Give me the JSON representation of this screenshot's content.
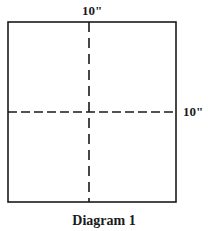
{
  "diagram": {
    "title": "Diagram 1",
    "shape": "square",
    "dimensions": {
      "top_label": "10\"",
      "right_label": "10\""
    },
    "fold_lines": [
      {
        "orientation": "vertical",
        "style": "dashed",
        "position": "center"
      },
      {
        "orientation": "horizontal",
        "style": "dashed",
        "position": "center"
      }
    ],
    "colors": {
      "stroke": "#1a1a1a",
      "background": "#ffffff"
    }
  }
}
